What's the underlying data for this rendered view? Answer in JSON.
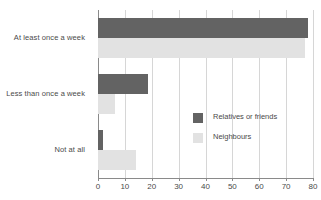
{
  "chart_data": {
    "type": "bar",
    "orientation": "horizontal",
    "title": "",
    "xlabel": "",
    "ylabel": "",
    "xlim": [
      0,
      80
    ],
    "xticks": [
      0,
      10,
      20,
      30,
      40,
      50,
      60,
      70,
      80
    ],
    "grid": true,
    "legend_position": "center-right",
    "categories": [
      "At least once a week",
      "Less than once a week",
      "Not at all"
    ],
    "series": [
      {
        "name": "Relatives or friends",
        "color": "#636363",
        "values": [
          78,
          18.5,
          2
        ]
      },
      {
        "name": "Neighbours",
        "color": "#e2e2e2",
        "values": [
          77,
          6.5,
          14
        ]
      }
    ]
  },
  "colors": {
    "series_dark": "#636363",
    "series_light": "#e2e2e2",
    "axis": "#8a8a8a",
    "grid": "#d6d6d6",
    "text": "#4a4a4a",
    "background": "#ffffff"
  }
}
